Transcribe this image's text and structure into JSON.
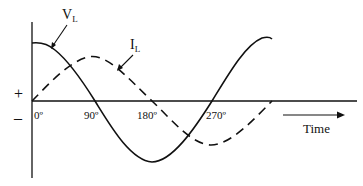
{
  "diagram": {
    "title": "",
    "curves": [
      {
        "name": "V_L",
        "label_main": "V",
        "label_sub": "L",
        "style": "solid",
        "description": "Inductor voltage (cosine-like, leads current by 90°)"
      },
      {
        "name": "I_L",
        "label_main": "I",
        "label_sub": "L",
        "style": "dashed",
        "description": "Inductor current (sine-like)"
      }
    ],
    "axis": {
      "positive_sign": "+",
      "negative_sign": "–",
      "ticks": [
        "0º",
        "90º",
        "180º",
        "270º"
      ],
      "time_label": "Time"
    },
    "colors": {
      "stroke": "#111111",
      "background": "#ffffff"
    }
  }
}
